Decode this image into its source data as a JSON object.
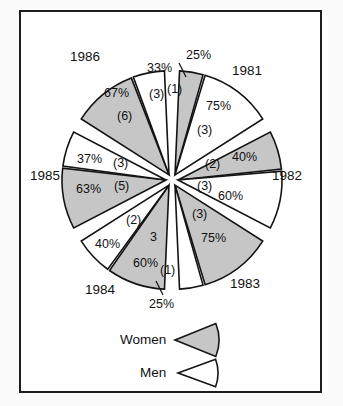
{
  "chart_data": {
    "type": "pie",
    "title": "",
    "subtitle": "",
    "xlabel": "",
    "ylabel": "",
    "legend_position": "bottom-center",
    "grid": false,
    "series": [
      {
        "name": "Women",
        "color": "#c6c6c6"
      },
      {
        "name": "Men",
        "color": "#ffffff"
      }
    ],
    "categories": [
      "1981",
      "1982",
      "1983",
      "1984",
      "1985",
      "1986"
    ],
    "groups": [
      {
        "year": "1981",
        "women": {
          "percent": 25,
          "percent_label": "25%",
          "count": 1,
          "count_label": "(1)"
        },
        "men": {
          "percent": 75,
          "percent_label": "75%",
          "count": 3,
          "count_label": "(3)"
        }
      },
      {
        "year": "1982",
        "women": {
          "percent": 40,
          "percent_label": "40%",
          "count": 2,
          "count_label": "(2)"
        },
        "men": {
          "percent": 60,
          "percent_label": "60%",
          "count": 3,
          "count_label": "(3)"
        }
      },
      {
        "year": "1983",
        "women": {
          "percent": 75,
          "percent_label": "75%",
          "count": 3,
          "count_label": "(3)"
        },
        "men": {
          "percent": 25,
          "percent_label": "25%",
          "count": 1,
          "count_label": "(1)"
        }
      },
      {
        "year": "1984",
        "women": {
          "percent": 60,
          "percent_label": "60%",
          "count": 3,
          "count_label": "3"
        },
        "men": {
          "percent": 40,
          "percent_label": "40%",
          "count": 2,
          "count_label": "(2)"
        }
      },
      {
        "year": "1985",
        "women": {
          "percent": 63,
          "percent_label": "63%",
          "count": 5,
          "count_label": "(5)"
        },
        "men": {
          "percent": 37,
          "percent_label": "37%",
          "count": 3,
          "count_label": "(3)"
        }
      },
      {
        "year": "1986",
        "women": {
          "percent": 67,
          "percent_label": "67%",
          "count": 6,
          "count_label": "(6)"
        },
        "men": {
          "percent": 33,
          "percent_label": "33%",
          "count": 3,
          "count_label": "(3)"
        }
      }
    ]
  },
  "labels": {
    "year_1981": "1981",
    "year_1982": "1982",
    "year_1983": "1983",
    "year_1984": "1984",
    "year_1985": "1985",
    "year_1986": "1986",
    "p1981_women": "25%",
    "c1981_women": "(1)",
    "p1981_men": "75%",
    "c1981_men": "(3)",
    "p1982_women": "40%",
    "c1982_women": "(2)",
    "p1982_men": "60%",
    "c1982_men": "(3)",
    "p1983_women": "75%",
    "c1983_women": "(3)",
    "p1983_men": "25%",
    "c1983_men": "(1)",
    "p1984_women": "60%",
    "c1984_women": "3",
    "p1984_men": "40%",
    "c1984_men": "(2)",
    "p1985_women": "63%",
    "c1985_women": "(5)",
    "p1985_men": "37%",
    "c1985_men": "(3)",
    "p1986_women": "67%",
    "c1986_women": "(6)",
    "p1986_men": "33%",
    "c1986_men": "(3)"
  },
  "legend": {
    "women_label": "Women",
    "men_label": "Men",
    "women_color": "#c6c6c6",
    "men_color": "#ffffff"
  },
  "colors": {
    "frame": "#1d1d1d",
    "outline": "#141414",
    "women_fill": "#c6c6c6",
    "men_fill": "#ffffff",
    "background": "#ffffff"
  }
}
